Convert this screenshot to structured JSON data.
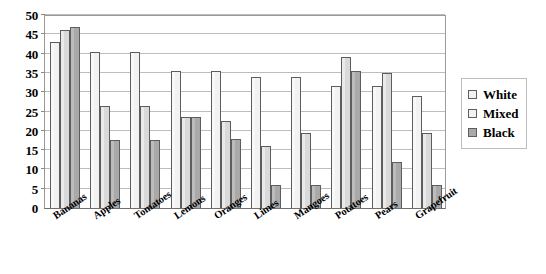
{
  "chart_data": {
    "type": "bar",
    "title": "",
    "xlabel": "",
    "ylabel": "",
    "ylim": [
      0,
      50
    ],
    "ytick_step": 5,
    "yticks": [
      50,
      45,
      40,
      35,
      30,
      25,
      20,
      15,
      10,
      5,
      0
    ],
    "grid": true,
    "legend_position": "right",
    "categories": [
      "Bananas",
      "Apples",
      "Tomatoes",
      "Lemons",
      "Oranges",
      "Limes",
      "Mangoes",
      "Potatoes",
      "Pears",
      "Grapefruit"
    ],
    "series": [
      {
        "name": "White",
        "color": "#f2f2f2",
        "values": [
          43,
          40.5,
          40.5,
          35.5,
          35.5,
          34,
          34,
          31.5,
          31.5,
          29
        ]
      },
      {
        "name": "Mixed",
        "color": "#d9d9d9",
        "values": [
          46,
          26.5,
          26.5,
          23.5,
          22.5,
          16,
          19.5,
          39,
          35,
          19.5
        ]
      },
      {
        "name": "Black",
        "color": "#a9a9a9",
        "values": [
          47,
          17.5,
          17.5,
          23.5,
          18,
          6,
          6,
          35.5,
          12,
          6
        ]
      }
    ]
  },
  "legend": {
    "items": [
      {
        "label": "White"
      },
      {
        "label": "Mixed"
      },
      {
        "label": "Black"
      }
    ]
  }
}
